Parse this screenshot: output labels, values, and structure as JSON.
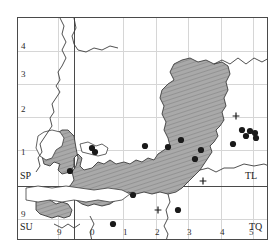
{
  "map": {
    "title": "Distribution map",
    "projection_note": "Ordnance Survey national grid",
    "frame": {
      "x": 17,
      "y": 17,
      "width": 251,
      "height": 223
    },
    "grid_squares": [
      {
        "code": "SP",
        "position": "bottom-left-of-upper-left-quadrant"
      },
      {
        "code": "SU",
        "position": "bottom-left-of-lower-left-quadrant"
      },
      {
        "code": "TL",
        "position": "bottom-right-of-upper-right-quadrant"
      },
      {
        "code": "TQ",
        "position": "bottom-right-of-lower-right-quadrant"
      }
    ],
    "axis": {
      "left_labels": [
        "4",
        "3",
        "2",
        "1",
        "9"
      ],
      "bottom_labels": [
        "9",
        "0",
        "1",
        "2",
        "3",
        "4",
        "5"
      ]
    },
    "legend": {
      "dot_meaning": "record",
      "cross_meaning": "old record"
    },
    "colors": {
      "land_fill": "#a8a8a8",
      "hatch": "#8e8e8e",
      "coast_line": "#3c3c3c",
      "grid_minor": "#d6d6d6",
      "grid_major": "#4a4a4a",
      "dot": "#1a1a1a"
    },
    "counts": {
      "dots": 17,
      "crosses": 3
    }
  },
  "ticks": {
    "left": [
      {
        "label": "4",
        "y": 42
      },
      {
        "label": "3",
        "y": 70
      },
      {
        "label": "2",
        "y": 105
      },
      {
        "label": "1",
        "y": 148
      },
      {
        "label": "9",
        "y": 210
      }
    ],
    "bottom": [
      {
        "label": "9",
        "x": 57
      },
      {
        "label": "0",
        "x": 90
      },
      {
        "label": "1",
        "x": 123
      },
      {
        "label": "2",
        "x": 155
      },
      {
        "label": "3",
        "x": 187
      },
      {
        "label": "4",
        "x": 220
      },
      {
        "label": "5",
        "x": 249
      }
    ]
  },
  "squares": [
    {
      "code": "SP",
      "x": 20,
      "y": 171
    },
    {
      "code": "SU",
      "x": 20,
      "y": 222
    },
    {
      "code": "TL",
      "x": 245,
      "y": 171
    },
    {
      "code": "TQ",
      "x": 249,
      "y": 222
    }
  ],
  "chart_data": {
    "type": "scatter",
    "xlabel": "",
    "ylabel": "",
    "grid": true,
    "legend": null,
    "series": [
      {
        "name": "record",
        "marker": "filled-circle",
        "points": [
          [
            52,
            153
          ],
          [
            74,
            130
          ],
          [
            77,
            134
          ],
          [
            127,
            128
          ],
          [
            150,
            129
          ],
          [
            163,
            122
          ],
          [
            183,
            132
          ],
          [
            177,
            141
          ],
          [
            215,
            126
          ],
          [
            224,
            112
          ],
          [
            232,
            113
          ],
          [
            237,
            115
          ],
          [
            115,
            177
          ],
          [
            160,
            192
          ],
          [
            95,
            206
          ],
          [
            238,
            120
          ],
          [
            228,
            118
          ]
        ]
      },
      {
        "name": "old record",
        "marker": "plus",
        "points": [
          [
            218,
            98
          ],
          [
            185,
            163
          ],
          [
            140,
            192
          ]
        ]
      }
    ]
  }
}
